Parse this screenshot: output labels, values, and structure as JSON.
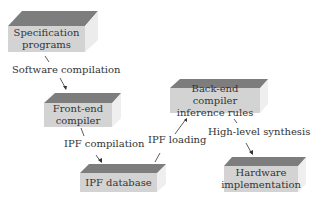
{
  "nodes": {
    "spec": {
      "label": "Specification programs",
      "line1": "Specification",
      "line2": "programs"
    },
    "frontend": {
      "line1": "Front-end",
      "line2": "compiler"
    },
    "ipfdb": {
      "line1": "IPF database"
    },
    "backend": {
      "line1": "Back-end compiler",
      "line2": "inference rules"
    },
    "hardware": {
      "line1": "Hardware",
      "line2": "implementation"
    }
  },
  "edges": {
    "software_compilation": "Software compilation",
    "ipf_compilation": "IPF compilation",
    "ipf_loading": "IPF loading",
    "high_level_synthesis": "High-level synthesis"
  },
  "colors": {
    "top_face": "#7d7d7d",
    "front_face": "#d3d3d3",
    "side_face": "#ececec"
  }
}
